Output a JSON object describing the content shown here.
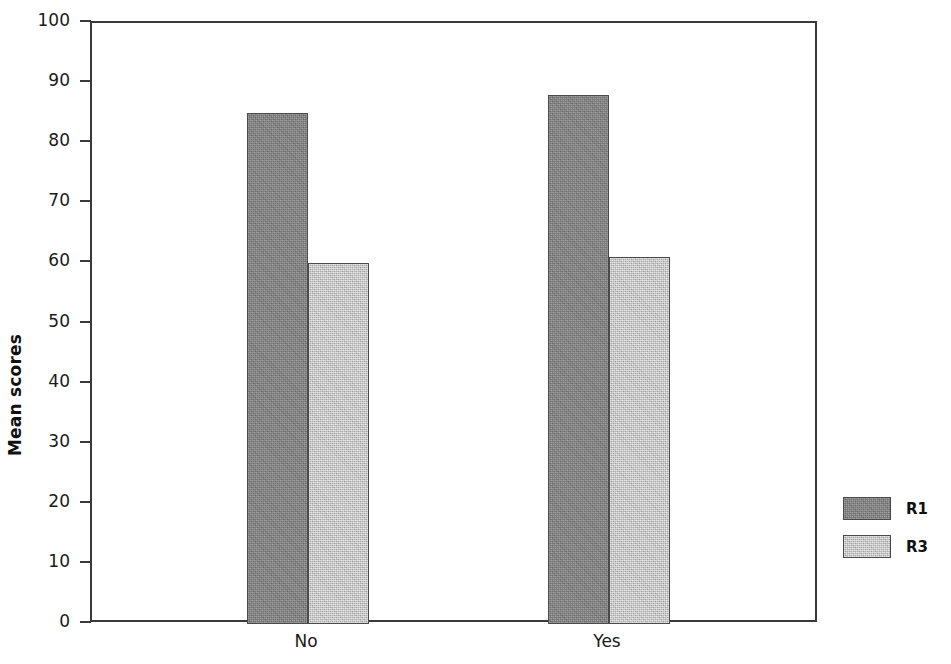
{
  "chart_data": {
    "type": "bar",
    "title": "",
    "subtitle": "",
    "xlabel": "",
    "ylabel": "Mean scores",
    "categories": [
      "No",
      "Yes"
    ],
    "series": [
      {
        "name": "R1",
        "values": [
          85,
          88
        ],
        "color": "#858585"
      },
      {
        "name": "R3",
        "values": [
          60,
          61
        ],
        "color": "#c9c9c9"
      }
    ],
    "ylim": [
      0,
      100
    ],
    "ytick_labels": [
      "100",
      "90",
      "80",
      "70",
      "60",
      "50",
      "40",
      "30",
      "20",
      "10",
      "0"
    ],
    "ytick_values": [
      100,
      90,
      80,
      70,
      60,
      50,
      40,
      30,
      20,
      10,
      0
    ],
    "grid": false,
    "legend_position": "right",
    "legend_entries": [
      "R1",
      "R3"
    ],
    "annotations": []
  },
  "axes": {
    "y": {
      "label": "Mean scores",
      "ticks": [
        {
          "label": "100",
          "value": 100
        },
        {
          "label": "90",
          "value": 90
        },
        {
          "label": "80",
          "value": 80
        },
        {
          "label": "70",
          "value": 70
        },
        {
          "label": "60",
          "value": 60
        },
        {
          "label": "50",
          "value": 50
        },
        {
          "label": "40",
          "value": 40
        },
        {
          "label": "30",
          "value": 30
        },
        {
          "label": "20",
          "value": 20
        },
        {
          "label": "10",
          "value": 10
        },
        {
          "label": "0",
          "value": 0
        }
      ]
    },
    "x": {
      "label": "",
      "categories": [
        {
          "label": "No"
        },
        {
          "label": "Yes"
        }
      ]
    }
  },
  "legend": {
    "items": [
      {
        "label": "R1",
        "color": "#858585"
      },
      {
        "label": "R3",
        "color": "#c9c9c9"
      }
    ]
  }
}
